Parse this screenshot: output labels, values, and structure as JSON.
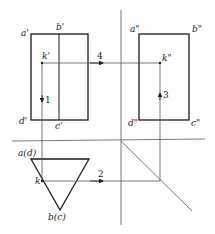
{
  "diagram": {
    "type": "orthographic-projection",
    "colors": {
      "line": "#1a1a1a",
      "thin": "#555555",
      "background": "#ffffff"
    },
    "front_view": {
      "labels": {
        "a": "a'",
        "b": "b'",
        "c": "c'",
        "d": "d'",
        "k": "k'"
      }
    },
    "side_view": {
      "labels": {
        "a": "a\"",
        "b": "b\"",
        "c": "c\"",
        "d": "d\"",
        "k": "k\""
      }
    },
    "top_view": {
      "labels": {
        "ad": "a(d)",
        "bc": "b(c)",
        "k": "k"
      }
    },
    "steps": {
      "s1": "1",
      "s2": "2",
      "s3": "3",
      "s4": "4"
    }
  }
}
